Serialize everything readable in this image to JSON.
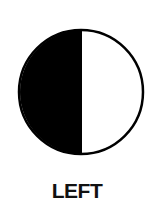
{
  "figure": {
    "label": "LEFT",
    "shape": "half-filled-circle",
    "filled_side": "left",
    "fill_color": "#000000",
    "empty_color": "#ffffff",
    "outline_color": "#000000"
  }
}
